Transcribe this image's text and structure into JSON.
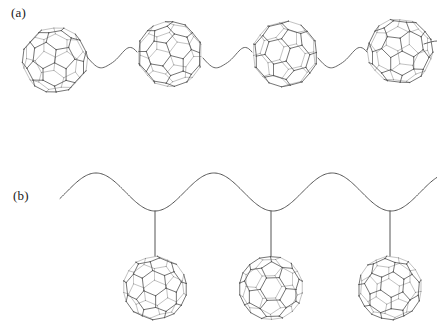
{
  "figure": {
    "title": "",
    "background_color": "#ffffff",
    "line_color": "#555555",
    "label_color": "#1a1a1a",
    "width": 437,
    "height": 323
  },
  "panels": [
    {
      "id": "a",
      "label": "(a)",
      "label_x": 11,
      "label_y": 5,
      "description": "main-chain fullerene polymer: C60 cages in-line along a wavy backbone",
      "chain": {
        "type": "wavy-inline",
        "stroke": "#555555",
        "stroke_width": 0.9,
        "baseline_y": 56,
        "amplitude": 13,
        "segments": [
          {
            "from_x": 88,
            "to_x": 137,
            "dip": "down"
          },
          {
            "from_x": 203,
            "to_x": 252,
            "dip": "down"
          },
          {
            "from_x": 318,
            "to_x": 367,
            "dip": "down"
          }
        ]
      },
      "fullerenes": [
        {
          "name": "c60-cage",
          "cx": 55,
          "cy": 60,
          "r": 33,
          "clipped": false
        },
        {
          "name": "c60-cage",
          "cx": 170,
          "cy": 54,
          "r": 33,
          "clipped": false
        },
        {
          "name": "c60-cage",
          "cx": 285,
          "cy": 54,
          "r": 33,
          "clipped": false
        },
        {
          "name": "c60-cage",
          "cx": 400,
          "cy": 51,
          "r": 33,
          "clipped": true
        }
      ]
    },
    {
      "id": "b",
      "label": "(b)",
      "label_x": 13,
      "label_y": 188,
      "description": "side-chain fullerene polymer: C60 cages pendant from sinusoidal backbone troughs",
      "chain": {
        "type": "sine-backbone",
        "stroke": "#555555",
        "stroke_width": 1.0,
        "start_x": 60,
        "end_x": 437,
        "midline_y": 192,
        "amplitude": 19,
        "wavelength": 118,
        "peak_y": 173,
        "trough_y": 211
      },
      "linkers": [
        {
          "name": "pendant-linker",
          "x": 155,
          "from_y": 211,
          "to_y": 256
        },
        {
          "name": "pendant-linker",
          "x": 271,
          "from_y": 211,
          "to_y": 256
        },
        {
          "name": "pendant-linker",
          "x": 390,
          "from_y": 211,
          "to_y": 256
        }
      ],
      "fullerenes": [
        {
          "name": "c60-cage",
          "cx": 155,
          "cy": 288,
          "r": 32,
          "clipped": false
        },
        {
          "name": "c60-cage",
          "cx": 271,
          "cy": 288,
          "r": 32,
          "clipped": false
        },
        {
          "name": "c60-cage",
          "cx": 390,
          "cy": 288,
          "r": 32,
          "clipped": true
        }
      ]
    }
  ]
}
